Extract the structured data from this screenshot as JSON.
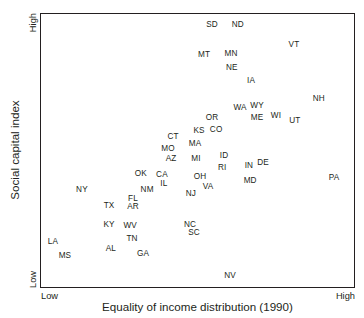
{
  "chart_data": {
    "type": "scatter",
    "title": "",
    "xlabel": "Equality of income distribution (1990)",
    "ylabel": "Social capital index",
    "xticks": [
      "Low",
      "High"
    ],
    "yticks": [
      "Low",
      "High"
    ],
    "xlim": [
      "Low",
      "High"
    ],
    "ylim": [
      "Low",
      "High"
    ],
    "grid": false,
    "legend": null,
    "point_label_style": "text-only (state abbreviation, no marker)",
    "points": [
      {
        "label": "SD",
        "x": 0.543,
        "y": 0.96
      },
      {
        "label": "ND",
        "x": 0.625,
        "y": 0.96
      },
      {
        "label": "VT",
        "x": 0.803,
        "y": 0.887
      },
      {
        "label": "MT",
        "x": 0.518,
        "y": 0.851
      },
      {
        "label": "MN",
        "x": 0.603,
        "y": 0.855
      },
      {
        "label": "NE",
        "x": 0.606,
        "y": 0.804
      },
      {
        "label": "IA",
        "x": 0.667,
        "y": 0.756
      },
      {
        "label": "NH",
        "x": 0.882,
        "y": 0.691
      },
      {
        "label": "WA",
        "x": 0.632,
        "y": 0.658
      },
      {
        "label": "WY",
        "x": 0.686,
        "y": 0.665
      },
      {
        "label": "ME",
        "x": 0.686,
        "y": 0.622
      },
      {
        "label": "WI",
        "x": 0.746,
        "y": 0.629
      },
      {
        "label": "UT",
        "x": 0.806,
        "y": 0.611
      },
      {
        "label": "OR",
        "x": 0.543,
        "y": 0.622
      },
      {
        "label": "KS",
        "x": 0.502,
        "y": 0.575
      },
      {
        "label": "CO",
        "x": 0.556,
        "y": 0.578
      },
      {
        "label": "CT",
        "x": 0.419,
        "y": 0.553
      },
      {
        "label": "MA",
        "x": 0.489,
        "y": 0.527
      },
      {
        "label": "MO",
        "x": 0.403,
        "y": 0.509
      },
      {
        "label": "AZ",
        "x": 0.413,
        "y": 0.473
      },
      {
        "label": "ID",
        "x": 0.581,
        "y": 0.484
      },
      {
        "label": "MI",
        "x": 0.492,
        "y": 0.473
      },
      {
        "label": "RI",
        "x": 0.575,
        "y": 0.44
      },
      {
        "label": "IN",
        "x": 0.66,
        "y": 0.447
      },
      {
        "label": "DE",
        "x": 0.705,
        "y": 0.458
      },
      {
        "label": "OK",
        "x": 0.317,
        "y": 0.418
      },
      {
        "label": "CA",
        "x": 0.384,
        "y": 0.415
      },
      {
        "label": "IL",
        "x": 0.39,
        "y": 0.382
      },
      {
        "label": "OH",
        "x": 0.505,
        "y": 0.407
      },
      {
        "label": "MD",
        "x": 0.664,
        "y": 0.393
      },
      {
        "label": "PA",
        "x": 0.93,
        "y": 0.404
      },
      {
        "label": "VA",
        "x": 0.53,
        "y": 0.371
      },
      {
        "label": "NM",
        "x": 0.337,
        "y": 0.36
      },
      {
        "label": "NY",
        "x": 0.13,
        "y": 0.36
      },
      {
        "label": "NJ",
        "x": 0.476,
        "y": 0.345
      },
      {
        "label": "FL",
        "x": 0.292,
        "y": 0.327
      },
      {
        "label": "AR",
        "x": 0.292,
        "y": 0.298
      },
      {
        "label": "TX",
        "x": 0.216,
        "y": 0.302
      },
      {
        "label": "KY",
        "x": 0.216,
        "y": 0.233
      },
      {
        "label": "WV",
        "x": 0.283,
        "y": 0.229
      },
      {
        "label": "NC",
        "x": 0.473,
        "y": 0.233
      },
      {
        "label": "SC",
        "x": 0.486,
        "y": 0.204
      },
      {
        "label": "TN",
        "x": 0.289,
        "y": 0.182
      },
      {
        "label": "LA",
        "x": 0.038,
        "y": 0.171
      },
      {
        "label": "AL",
        "x": 0.222,
        "y": 0.145
      },
      {
        "label": "GA",
        "x": 0.324,
        "y": 0.127
      },
      {
        "label": "MS",
        "x": 0.076,
        "y": 0.12
      },
      {
        "label": "NV",
        "x": 0.6,
        "y": 0.047
      }
    ]
  },
  "axes": {
    "x_title": "Equality of income distribution (1990)",
    "y_title": "Social capital index",
    "x_low": "Low",
    "x_high": "High",
    "y_low": "Low",
    "y_high": "High"
  },
  "colors": {
    "ink": "#231f20",
    "background": "#ffffff",
    "frame": "#231f20"
  }
}
